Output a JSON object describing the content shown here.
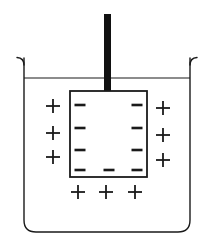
{
  "figure": {
    "background_color": "#ffffff",
    "line_color": "#1a1a1a",
    "rod_color": "#111111",
    "canvas": {
      "width": 212,
      "height": 246
    }
  },
  "beaker": {
    "name": "beaker",
    "left": 24,
    "right": 190,
    "top": 58,
    "bottom": 232,
    "corner_radius": 12,
    "stroke_width": 1.4,
    "rim_lip_radius": 7,
    "rim_lip_extent": 12
  },
  "liquid": {
    "name": "liquid-surface",
    "surface_y": 78,
    "left": 24,
    "right": 190,
    "stroke_width": 1.2
  },
  "rod": {
    "name": "electrode-rod",
    "x": 104,
    "width": 7,
    "top": 14,
    "bottom": 92,
    "color": "#111111"
  },
  "plate": {
    "name": "electrode-plate",
    "left": 70,
    "right": 147,
    "top": 91,
    "bottom": 177,
    "stroke_width": 1.8,
    "fill": "#ffffff"
  },
  "charges": {
    "minus_symbol": "−",
    "plus_symbol": "+",
    "minus_bar": {
      "width": 11,
      "height": 2.6
    },
    "plus_bar": {
      "length": 14,
      "thickness": 1.8
    },
    "negative_inside": {
      "label": "negative-charges-inside-plate",
      "left_column_x": 80,
      "right_column_x": 137,
      "column_rows_y": [
        105,
        128,
        150,
        170
      ],
      "bottom_row_y": 170,
      "bottom_row_x": [
        80,
        109,
        137
      ],
      "count": 11
    },
    "positive_outside": {
      "label": "positive-charges-in-electrolyte",
      "left_column_x": 53,
      "left_column_y": [
        106,
        133,
        157
      ],
      "right_column_x": 163,
      "right_column_y": [
        108,
        135,
        160
      ],
      "bottom_row_y": 192,
      "bottom_row_x": [
        78,
        106,
        135
      ],
      "count": 9
    }
  },
  "legend": {
    "negative_label": "−",
    "positive_label": "+",
    "negative_meaning": "negative-charge",
    "positive_meaning": "positive-charge"
  }
}
